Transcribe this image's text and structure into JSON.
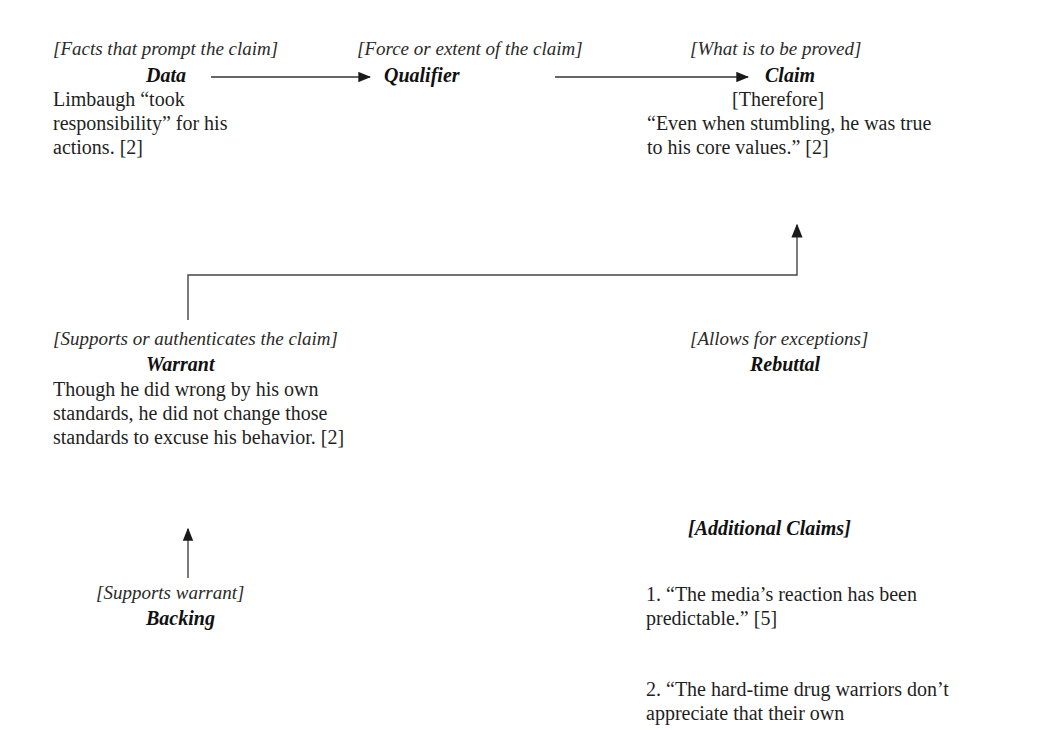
{
  "diagram": {
    "data": {
      "subtitle": "[Facts that prompt the claim]",
      "title": "Data",
      "text": "Limbaugh “took responsibility” for his actions. [2]"
    },
    "qualifier": {
      "subtitle": "[Force or extent of the claim]",
      "title": "Qualifier"
    },
    "claim": {
      "subtitle": "[What is to be proved]",
      "title": "Claim",
      "connector": "[Therefore]",
      "text": "“Even when stumbling, he was true to his core values.” [2]"
    },
    "warrant": {
      "subtitle": "[Supports or authenticates the claim]",
      "title": "Warrant",
      "text": "Though he did wrong by his own standards, he did not change those standards to excuse his behavior. [2]"
    },
    "rebuttal": {
      "subtitle": "[Allows for exceptions]",
      "title": "Rebuttal"
    },
    "backing": {
      "subtitle": "[Supports warrant]",
      "title": "Backing"
    },
    "additional_claims": {
      "title": "[Additional Claims]",
      "items": [
        "1. “The media’s reaction has been predictable.” [5]",
        "2. “The hard-time drug warriors don’t appreciate that their own"
      ]
    }
  }
}
